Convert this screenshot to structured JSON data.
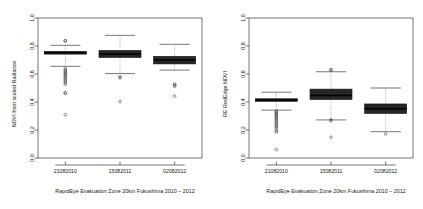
{
  "figure": {
    "background_color": "#ffffff",
    "panel_count": 2,
    "box_fill_color": "#262626",
    "median_color": "#000000",
    "whisker_color": "#8a8a8a",
    "frame_color": "#3d3d3d"
  },
  "chart_data": [
    {
      "type": "box",
      "panel": "left",
      "title": "",
      "xlabel": "RapidEye Evakuation Zone 20km Fukushima 2010 – 2012",
      "ylabel": "NDVI from scaled Radiance",
      "ylim": [
        0.0,
        1.0
      ],
      "yticks": [
        0.0,
        0.2,
        0.4,
        0.6,
        0.8,
        1.0
      ],
      "yticklabels": [
        "0.0",
        "0.2",
        "0.4",
        "0.6",
        "0.8",
        "1.0"
      ],
      "grid": false,
      "legend": "none",
      "categories": [
        "21082010",
        "15082011",
        "02082012"
      ],
      "boxes": [
        {
          "category": "21082010",
          "whisker_low": 0.655,
          "q1": 0.742,
          "median": 0.752,
          "q3": 0.762,
          "whisker_high": 0.805,
          "outliers": [
            0.836,
            0.838,
            0.64,
            0.63,
            0.62,
            0.612,
            0.604,
            0.596,
            0.588,
            0.578,
            0.568,
            0.558,
            0.548,
            0.538,
            0.528,
            0.466,
            0.462,
            0.31
          ]
        },
        {
          "category": "15082011",
          "whisker_low": 0.603,
          "q1": 0.718,
          "median": 0.742,
          "q3": 0.768,
          "whisker_high": 0.876,
          "outliers": [
            0.578,
            0.574,
            0.402
          ]
        },
        {
          "category": "02082012",
          "whisker_low": 0.628,
          "q1": 0.672,
          "median": 0.7,
          "q3": 0.726,
          "whisker_high": 0.812,
          "outliers": [
            0.528,
            0.52,
            0.512,
            0.442
          ]
        }
      ]
    },
    {
      "type": "box",
      "panel": "right",
      "title": "",
      "xlabel": "RapidEye Evakuation Zone 20km Fukushima 2010 – 2012",
      "ylabel": "RE RedEdge NDVI",
      "ylim": [
        0.0,
        1.0
      ],
      "yticks": [
        0.0,
        0.2,
        0.4,
        0.6,
        0.8,
        1.0
      ],
      "yticklabels": [
        "0.0",
        "0.2",
        "0.4",
        "0.6",
        "0.8",
        "1.0"
      ],
      "grid": false,
      "legend": "none",
      "categories": [
        "21082010",
        "15082011",
        "02082012"
      ],
      "boxes": [
        {
          "category": "21082010",
          "whisker_low": 0.342,
          "q1": 0.405,
          "median": 0.414,
          "q3": 0.423,
          "whisker_high": 0.47,
          "outliers": [
            0.336,
            0.33,
            0.322,
            0.314,
            0.306,
            0.298,
            0.29,
            0.282,
            0.272,
            0.262,
            0.252,
            0.242,
            0.232,
            0.222,
            0.212,
            0.196,
            0.186,
            0.06
          ]
        },
        {
          "category": "15082011",
          "whisker_low": 0.272,
          "q1": 0.418,
          "median": 0.446,
          "q3": 0.492,
          "whisker_high": 0.616,
          "outliers": [
            0.632,
            0.628,
            0.272,
            0.268,
            0.148
          ]
        },
        {
          "category": "02082012",
          "whisker_low": 0.188,
          "q1": 0.318,
          "median": 0.352,
          "q3": 0.386,
          "whisker_high": 0.5,
          "outliers": [
            0.172
          ]
        }
      ]
    }
  ]
}
